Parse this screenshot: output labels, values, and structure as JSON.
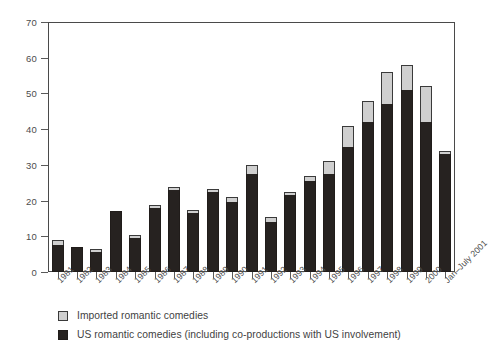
{
  "chart_data": {
    "type": "bar",
    "stacked": true,
    "title": "",
    "subtitle": "",
    "xlabel": "",
    "ylabel": "",
    "ylim": [
      0,
      70
    ],
    "ytick_step": 10,
    "yticks": [
      0,
      10,
      20,
      30,
      40,
      50,
      60,
      70
    ],
    "grid": true,
    "grid_axis": "y",
    "legend_position": "bottom-left",
    "categories": [
      "1981",
      "1982",
      "1983",
      "1984",
      "1985",
      "1986",
      "1987",
      "1988",
      "1989",
      "1990",
      "1991",
      "1992",
      "1993",
      "1994",
      "1995",
      "1996",
      "1997",
      "1998",
      "1999",
      "2000",
      "Jan–July 2001"
    ],
    "series": [
      {
        "name": "US romantic comedies (including co-productions with US involvement)",
        "color": "#262220",
        "values": [
          7.5,
          7,
          5.5,
          17,
          9.5,
          18,
          23,
          16.5,
          22.5,
          19.5,
          27.5,
          14,
          21.5,
          25.5,
          27.5,
          35,
          42,
          47,
          51,
          42,
          33
        ]
      },
      {
        "name": "Imported romantic comedies",
        "color": "#cfcfcf",
        "values": [
          1.5,
          0,
          1,
          0,
          0.5,
          0.5,
          0.5,
          0.5,
          0.5,
          1.5,
          2.5,
          1.5,
          1,
          1.5,
          3.5,
          6,
          6,
          9,
          7,
          10,
          1
        ]
      }
    ],
    "totals": [
      9,
      7,
      6.5,
      17,
      10,
      18.5,
      23.5,
      17,
      23,
      21,
      30,
      15.5,
      22.5,
      27,
      31,
      41,
      48,
      56,
      58,
      52,
      34
    ]
  },
  "legend": {
    "items": [
      {
        "label": "Imported romantic comedies",
        "swatch": "imported"
      },
      {
        "label": "US romantic comedies (including co-productions with US involvement)",
        "swatch": "us"
      }
    ]
  }
}
